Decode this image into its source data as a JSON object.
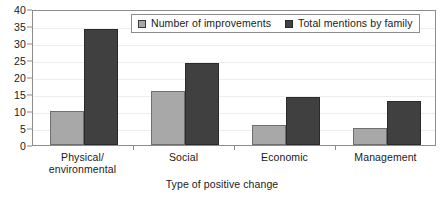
{
  "chart_data": {
    "type": "bar",
    "title": "",
    "xlabel": "Type of positive change",
    "ylabel": "",
    "categories": [
      "Physical/\nenvironmental",
      "Social",
      "Economic",
      "Management"
    ],
    "category_labels": [
      "Physical/ environmental",
      "Social",
      "Economic",
      "Management"
    ],
    "series": [
      {
        "name": "Number of improvements",
        "values": [
          10,
          16,
          6,
          5
        ],
        "color": "#a8a8a8"
      },
      {
        "name": "Total mentions by family",
        "values": [
          34,
          24,
          14,
          13
        ],
        "color": "#404040"
      }
    ],
    "ylim": [
      0,
      40
    ],
    "ytick_step": 5,
    "yticks": [
      0,
      5,
      10,
      15,
      20,
      25,
      30,
      35,
      40
    ],
    "ytick_labels": [
      "0",
      "5",
      "10",
      "15",
      "20",
      "25",
      "30",
      "35",
      "40"
    ],
    "grid": true,
    "grid_axis": "y",
    "legend_position": "top-right-inside",
    "plot_border": true
  }
}
